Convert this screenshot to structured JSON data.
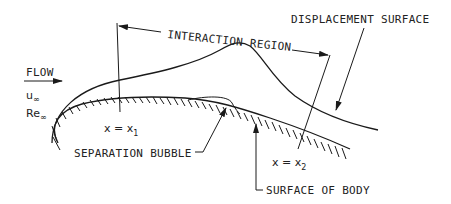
{
  "diagram": {
    "type": "flow-interaction-schematic",
    "labels": {
      "flow": "FLOW",
      "u_inf": "u",
      "u_inf_sub": "∞",
      "re_inf": "Re",
      "re_inf_sub": "∞",
      "interaction_region": "INTERACTION REGION",
      "displacement_surface": "DISPLACEMENT SURFACE",
      "x1": "x = x",
      "x1_sub": "1",
      "x2": "x = x",
      "x2_sub": "2",
      "separation_bubble": "SEPARATION BUBBLE",
      "surface_of_body": "SURFACE OF BODY"
    },
    "colors": {
      "ink": "#1a1a1a",
      "background": "#ffffff"
    }
  }
}
